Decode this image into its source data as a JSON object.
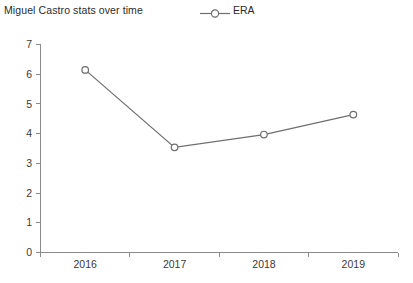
{
  "chart_data": {
    "type": "line",
    "title": "Miguel Castro stats over time",
    "xlabel": "",
    "ylabel": "",
    "categories": [
      "2016",
      "2017",
      "2018",
      "2019"
    ],
    "series": [
      {
        "name": "ERA",
        "values": [
          6.13,
          3.53,
          3.96,
          4.63
        ],
        "color": "#6e6e6e",
        "marker": "open-circle"
      }
    ],
    "legend": {
      "position": "top-center",
      "entries": [
        "ERA"
      ]
    },
    "ylim": [
      0,
      7
    ],
    "yticks": [
      "0",
      "1",
      "2",
      "3",
      "4",
      "5",
      "6",
      "7"
    ],
    "xticks": [
      "2016",
      "2017",
      "2018",
      "2019"
    ],
    "grid": false,
    "background": "#ffffff",
    "axis_color": "#8a8a8a"
  }
}
